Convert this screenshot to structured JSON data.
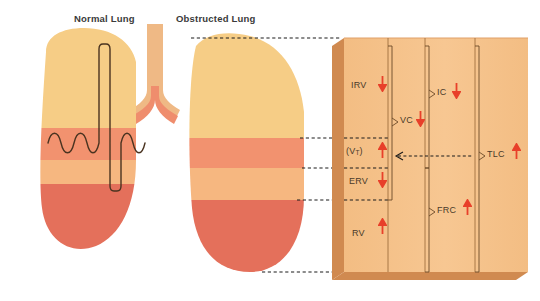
{
  "figure": {
    "type": "medical-diagram",
    "background_color": "#ffffff"
  },
  "headers": [
    {
      "id": "normal",
      "label": "Normal Lung"
    },
    {
      "id": "obstructed",
      "label": "Obstructed Lung"
    }
  ],
  "colors": {
    "band_irv": "#f6cd86",
    "band_vt": "#f2926f",
    "band_erv": "#f6b780",
    "band_rv": "#e4705b",
    "panel_face": "#f5c28a",
    "panel_left_edge": "#d08a50",
    "panel_bottom_edge": "#d08a50",
    "panel_rule": "#a07040",
    "arrow_red": "#e8402a",
    "label_text": "#4a3b2a",
    "header_text": "#3a3a3a",
    "trachea": "#efb985",
    "bronchi": "#ef8d6d",
    "spirogram_trace": "#4a3320",
    "leader_dash": "#1a1a1a"
  },
  "lung_bands": [
    {
      "name": "IRV",
      "color": "#f6cd86"
    },
    {
      "name": "VT",
      "color": "#f2926f"
    },
    {
      "name": "ERV",
      "color": "#f6b780"
    },
    {
      "name": "RV",
      "color": "#e4705b"
    }
  ],
  "panel": {
    "rows": [
      {
        "id": "irv",
        "label": "IRV",
        "label_display": "IRV",
        "subscript": "",
        "change": "decreased",
        "arrow": "down"
      },
      {
        "id": "vt",
        "label": "(VT)",
        "label_display": "(V",
        "subscript": "T",
        "label_tail": ")",
        "change": "increased",
        "arrow": "up"
      },
      {
        "id": "erv",
        "label": "ERV",
        "label_display": "ERV",
        "subscript": "",
        "change": "decreased",
        "arrow": "down"
      },
      {
        "id": "rv",
        "label": "RV",
        "label_display": "RV",
        "subscript": "",
        "change": "increased",
        "arrow": "up"
      }
    ],
    "capacities": [
      {
        "id": "vc",
        "label": "VC",
        "change": "decreased",
        "arrow": "down",
        "bracket": ">"
      },
      {
        "id": "ic",
        "label": "IC",
        "change": "decreased",
        "arrow": "down",
        "bracket": ">"
      },
      {
        "id": "frc",
        "label": "FRC",
        "change": "increased",
        "arrow": "up",
        "bracket": ">"
      },
      {
        "id": "tlc",
        "label": "TLC",
        "change": "increased",
        "arrow": "up",
        "bracket": ">"
      }
    ]
  }
}
